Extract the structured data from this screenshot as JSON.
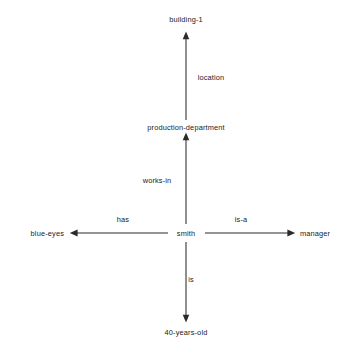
{
  "diagram": {
    "type": "semantic-network",
    "title": "",
    "background_color": "#ffffff",
    "line_color": "#2a2a2a",
    "text_color": "#1b1b1b",
    "center_node": "smith",
    "nodes": [
      {
        "id": "building-1",
        "label": "building-1",
        "x": 186,
        "y": 19
      },
      {
        "id": "production-department",
        "label": "production-department",
        "x": 186,
        "y": 127
      },
      {
        "id": "blue-eyes",
        "label": "blue-eyes",
        "x": 64,
        "y": 233
      },
      {
        "id": "smith",
        "label": "smith",
        "x": 186,
        "y": 233
      },
      {
        "id": "manager",
        "label": "manager",
        "x": 300,
        "y": 233
      },
      {
        "id": "40-years-old",
        "label": "40-years-old",
        "x": 186,
        "y": 332
      }
    ],
    "edges": [
      {
        "from": "smith",
        "to": "production-department",
        "label": "works-in",
        "direction": "up",
        "label_x": 157,
        "label_y": 180
      },
      {
        "from": "production-department",
        "to": "building-1",
        "label": "location",
        "direction": "up",
        "label_x": 211,
        "label_y": 77
      },
      {
        "from": "smith",
        "to": "blue-eyes",
        "label": "has",
        "direction": "left",
        "label_x": 123,
        "label_y": 219
      },
      {
        "from": "smith",
        "to": "manager",
        "label": "is-a",
        "direction": "right",
        "label_x": 241,
        "label_y": 219
      },
      {
        "from": "smith",
        "to": "40-years-old",
        "label": "is",
        "direction": "down",
        "label_x": 191,
        "label_y": 279
      }
    ]
  }
}
